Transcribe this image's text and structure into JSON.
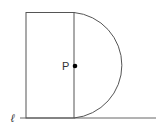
{
  "diagram": {
    "point_label": "P",
    "line_label": "ℓ",
    "colors": {
      "stroke": "#555555",
      "point": "#000000",
      "background": "#ffffff"
    },
    "shapes": {
      "rectangle": {
        "x": 26,
        "y": 12,
        "width": 48,
        "height": 106
      },
      "semicircle": {
        "center_x": 74,
        "center_y": 65,
        "radius": 53
      },
      "line": {
        "x1": 20,
        "y1": 118,
        "x2": 156,
        "y2": 118
      },
      "point": {
        "x": 75,
        "y": 66
      }
    }
  }
}
